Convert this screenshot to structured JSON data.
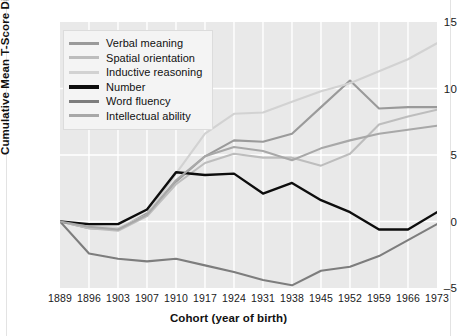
{
  "chart_data": {
    "type": "line",
    "title": "",
    "xlabel": "Cohort (year of birth)",
    "ylabel": "Cumulative Mean T-Score Differences",
    "categories": [
      1889,
      1896,
      1903,
      1907,
      1910,
      1917,
      1924,
      1931,
      1938,
      1945,
      1952,
      1959,
      1966,
      1973
    ],
    "xtick_labels": [
      "1889",
      "1896",
      "1903",
      "1907",
      "1910",
      "1917",
      "1924",
      "1931",
      "1938",
      "1945",
      "1952",
      "1959",
      "1966",
      "1973"
    ],
    "ytick_labels": [
      "15",
      "10",
      "5",
      "0",
      "–5"
    ],
    "ytick_values": [
      15,
      10,
      5,
      0,
      -5
    ],
    "ylim": [
      -5,
      15
    ],
    "grid": true,
    "legend_position": "upper-left",
    "series": [
      {
        "name": "Verbal meaning",
        "color": "#9a9a9a",
        "width": 2.1,
        "values": [
          0,
          -0.5,
          -0.6,
          0.6,
          3.0,
          4.9,
          6.1,
          6.0,
          6.6,
          8.6,
          10.6,
          8.5,
          8.6,
          8.6
        ]
      },
      {
        "name": "Spatial orientation",
        "color": "#bdbdbd",
        "width": 2.1,
        "values": [
          0,
          -0.5,
          -0.7,
          0.4,
          2.8,
          4.4,
          5.1,
          4.8,
          4.8,
          4.2,
          5.1,
          7.3,
          7.9,
          8.4
        ]
      },
      {
        "name": "Inductive reasoning",
        "color": "#d2d2d2",
        "width": 2.1,
        "values": [
          0,
          -0.3,
          -0.5,
          0.5,
          3.6,
          6.6,
          8.1,
          8.2,
          9.0,
          9.8,
          10.4,
          11.3,
          12.2,
          13.4
        ]
      },
      {
        "name": "Number",
        "color": "#0d0d0d",
        "width": 2.4,
        "values": [
          0,
          -0.2,
          -0.2,
          0.9,
          3.7,
          3.5,
          3.6,
          2.1,
          2.9,
          1.6,
          0.7,
          -0.6,
          -0.6,
          0.7
        ]
      },
      {
        "name": "Word fluency",
        "color": "#7d7d7d",
        "width": 2.1,
        "values": [
          0,
          -2.4,
          -2.8,
          -3.0,
          -2.8,
          -3.3,
          -3.8,
          -4.4,
          -4.8,
          -3.7,
          -3.4,
          -2.6,
          -1.4,
          -0.2
        ]
      },
      {
        "name": "Intellectual ability",
        "color": "#a8a8a8",
        "width": 2.1,
        "values": [
          0,
          -0.4,
          -0.6,
          0.5,
          3.1,
          4.9,
          5.6,
          5.3,
          4.6,
          5.5,
          6.1,
          6.6,
          6.9,
          7.2
        ]
      }
    ]
  },
  "axes": {
    "y_title": "Cumulative Mean T-Score Differences",
    "x_title": "Cohort (year of birth)"
  },
  "legend": {
    "items": [
      {
        "label": "Verbal meaning",
        "color": "#9a9a9a",
        "thickness": 3
      },
      {
        "label": "Spatial orientation",
        "color": "#bdbdbd",
        "thickness": 3
      },
      {
        "label": "Inductive reasoning",
        "color": "#d2d2d2",
        "thickness": 3
      },
      {
        "label": "Number",
        "color": "#0d0d0d",
        "thickness": 4
      },
      {
        "label": "Word fluency",
        "color": "#7d7d7d",
        "thickness": 3
      },
      {
        "label": "Intellectual ability",
        "color": "#a8a8a8",
        "thickness": 3
      }
    ]
  },
  "style": {
    "plot_background": "#e9e9e9",
    "gridline_color": "#ffffff",
    "page_background": "#ffffff",
    "text_color": "#1a1a1a"
  }
}
